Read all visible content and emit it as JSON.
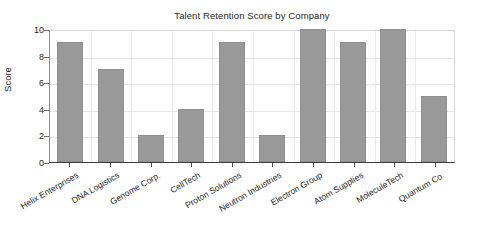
{
  "chart_data": {
    "type": "bar",
    "title": "Talent Retention Score by Company",
    "xlabel": "",
    "ylabel": "Score",
    "categories": [
      "Helix Enterprises",
      "DNA Logistics",
      "Genome Corp.",
      "CellTech",
      "Proton Solutions",
      "Neutron Industries",
      "Electron Group",
      "Atom Supplies",
      "MoleculeTech",
      "Quantum Co."
    ],
    "values": [
      9,
      7,
      2,
      4,
      9,
      2,
      10,
      9,
      10,
      5
    ],
    "ylim": [
      0,
      10
    ],
    "yticks": [
      0,
      2,
      4,
      6,
      8,
      10
    ],
    "ytick_labels": [
      "0",
      "2",
      "4",
      "6",
      "8",
      "10"
    ],
    "grid": true,
    "legend": false,
    "bar_color": "#999999",
    "bar_edge_color": "#8f8f8f",
    "background_color": "#ffffff",
    "axis_color": "#3b3b3b",
    "text_color": "#262626",
    "xtick_label_rotation": -30
  }
}
